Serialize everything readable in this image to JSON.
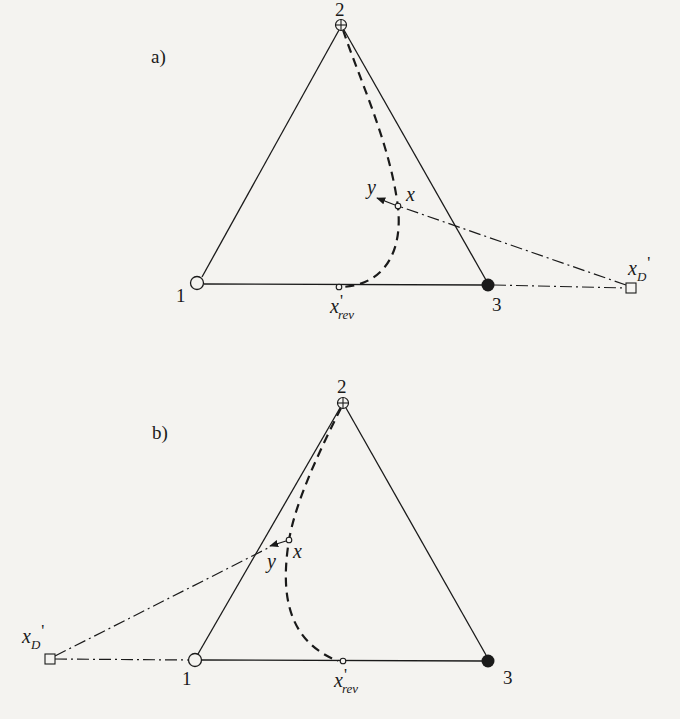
{
  "figure": {
    "colors": {
      "background": "#f4f3f0",
      "ink": "#1a1a1a"
    }
  },
  "panels": [
    {
      "id": "a",
      "label": "a)",
      "vertices": [
        {
          "id": "1",
          "label": "1",
          "marker": "open-circle"
        },
        {
          "id": "2",
          "label": "2",
          "marker": "circle-plus"
        },
        {
          "id": "3",
          "label": "3",
          "marker": "filled-circle"
        }
      ],
      "points": {
        "x": {
          "label": "x",
          "marker": "small-open-circle"
        },
        "y": {
          "label": "y",
          "marker": "arrowhead"
        },
        "x_rev": {
          "label_main": "x",
          "label_prime": "'",
          "label_sub": "rev",
          "marker": "small-open-circle"
        },
        "x_D": {
          "label_main": "x",
          "label_sub": "D",
          "label_prime": "'",
          "marker": "open-square"
        }
      },
      "lines": {
        "triangle": "solid",
        "residue_curve": "dashed",
        "operating_line": "dash-dot",
        "extension_1_3": "dash-dot"
      }
    },
    {
      "id": "b",
      "label": "b)",
      "vertices": [
        {
          "id": "1",
          "label": "1",
          "marker": "open-circle"
        },
        {
          "id": "2",
          "label": "2",
          "marker": "circle-plus"
        },
        {
          "id": "3",
          "label": "3",
          "marker": "filled-circle"
        }
      ],
      "points": {
        "x": {
          "label": "x",
          "marker": "small-open-circle"
        },
        "y": {
          "label": "y",
          "marker": "arrowhead"
        },
        "x_rev": {
          "label_main": "x",
          "label_prime": "'",
          "label_sub": "rev",
          "marker": "small-open-circle"
        },
        "x_D": {
          "label_main": "x",
          "label_sub": "D",
          "label_prime": "'",
          "marker": "open-square"
        }
      },
      "lines": {
        "triangle": "solid",
        "residue_curve": "dashed",
        "operating_line": "dash-dot",
        "extension_1_3": "dash-dot"
      }
    }
  ]
}
